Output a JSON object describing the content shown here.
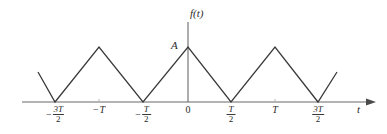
{
  "figure": {
    "name": "triangular-waveform-plot",
    "background_color": "#ffffff",
    "curve_color": "#3a3a3a",
    "axis_color": "#8c8c8c",
    "text_color": "#2b2b2b"
  },
  "axes": {
    "y_axis_label": "f(t)",
    "x_axis_label": "t",
    "amplitude_label": "A",
    "origin_label": "0"
  },
  "ticks": [
    {
      "sign": "−",
      "numerator": "3T",
      "denominator": "2",
      "is_fraction": true,
      "plain": "",
      "x": 55
    },
    {
      "sign": "−",
      "numerator": "",
      "denominator": "",
      "is_fraction": false,
      "plain": "T",
      "x": 99
    },
    {
      "sign": "−",
      "numerator": "T",
      "denominator": "2",
      "is_fraction": true,
      "plain": "",
      "x": 143
    },
    {
      "sign": "",
      "numerator": "",
      "denominator": "",
      "is_fraction": false,
      "plain": "0",
      "x": 188
    },
    {
      "sign": "",
      "numerator": "T",
      "denominator": "2",
      "is_fraction": true,
      "plain": "",
      "x": 231
    },
    {
      "sign": "",
      "numerator": "",
      "denominator": "",
      "is_fraction": false,
      "plain": "T",
      "x": 275
    },
    {
      "sign": "",
      "numerator": "3T",
      "denominator": "2",
      "is_fraction": true,
      "plain": "",
      "x": 318
    }
  ],
  "chart_data": {
    "type": "line",
    "title": "",
    "xlabel": "t",
    "ylabel": "f(t)",
    "amplitude": "A",
    "period": "T",
    "grid": false,
    "legend": false,
    "xlim": [
      -1.85,
      2.0
    ],
    "ylim": [
      0,
      1.25
    ],
    "x_tick_values": [
      -1.5,
      -1.0,
      -0.5,
      0,
      0.5,
      1.0,
      1.5
    ],
    "x_tick_labels": [
      "−3T/2",
      "−T",
      "−T/2",
      "0",
      "T/2",
      "T",
      "3T/2"
    ],
    "series": [
      {
        "name": "f(t)",
        "color": "#3a3a3a",
        "points_t": [
          -1.81,
          -1.5,
          -1.0,
          -0.5,
          0.0,
          0.5,
          1.0,
          1.5,
          1.71
        ],
        "points_f": [
          0.34,
          0.0,
          1.0,
          0.0,
          1.0,
          0.0,
          1.0,
          0.0,
          0.34
        ]
      }
    ],
    "pixel_geometry": {
      "baseline_y": 102,
      "peak_y": 47,
      "y_axis_x": 188,
      "axis_left_x": 22,
      "axis_right_x": 366,
      "y_axis_top": 22,
      "polyline": "38,72 55,102 99,47 143,102 188,47 231,102 275,47 318,102 337,72"
    }
  }
}
